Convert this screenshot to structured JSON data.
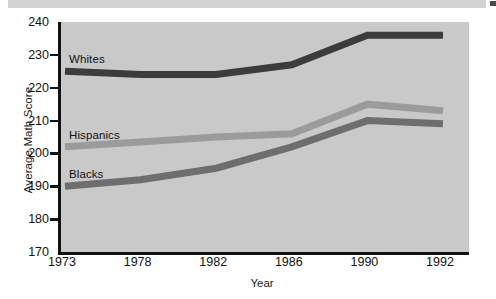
{
  "figure": {
    "background_color": "#ffffff",
    "plot_background_color": "#c9c9c9",
    "axis_color": "#111111",
    "top_strip": {
      "text": "",
      "note": "cropped caption row above the figure"
    }
  },
  "chart_data": {
    "type": "line",
    "title": "",
    "xlabel": "Year",
    "ylabel": "Average Math Score",
    "categories": [
      "1973",
      "1978",
      "1982",
      "1986",
      "1990",
      "1992"
    ],
    "x": [
      1973,
      1978,
      1982,
      1986,
      1990,
      1992
    ],
    "ylim": [
      170,
      240
    ],
    "yticks": [
      170,
      180,
      190,
      200,
      210,
      220,
      230,
      240
    ],
    "ytick_labels": [
      "170",
      "180",
      "190",
      "200",
      "210",
      "220",
      "230",
      "240"
    ],
    "grid": false,
    "legend_position": "inline-annotations",
    "axis_spacing": "categorical-even",
    "series": [
      {
        "name": "Whites",
        "color": "#3c3c3c",
        "values": [
          225,
          224,
          224,
          227,
          236,
          236
        ],
        "annotation": "Whites"
      },
      {
        "name": "Hispanics",
        "color": "#9b9b9b",
        "values": [
          202,
          203.5,
          205,
          206,
          215,
          213
        ],
        "annotation": "Hispanics"
      },
      {
        "name": "Blacks",
        "color": "#6e6e6e",
        "values": [
          190,
          192,
          195.5,
          202,
          210,
          209
        ],
        "annotation": "Blacks"
      }
    ]
  }
}
